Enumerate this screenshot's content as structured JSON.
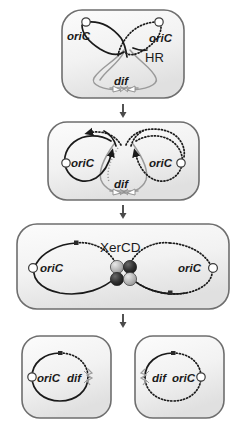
{
  "figure": {
    "width": 246,
    "height": 440,
    "colors": {
      "cell_fill_light": "#fbfbfb",
      "cell_fill_shadow": "#e3e3e3",
      "cell_border": "#6e6e6e",
      "chromosome_dark": "#1a1a1a",
      "chromosome_grey": "#9a9a9a",
      "arrow": "#4a4a4a",
      "background": "#ffffff"
    }
  },
  "panels": [
    {
      "id": "panel-1",
      "name": "dimer-formation",
      "labels": {
        "oric_left": "oriC",
        "oric_right": "oriC",
        "hr": "HR",
        "dif": "dif"
      }
    },
    {
      "id": "panel-2",
      "name": "dimer-segregation",
      "labels": {
        "oric_left": "oriC",
        "oric_right": "oriC",
        "dif": "dif"
      }
    },
    {
      "id": "panel-3",
      "name": "xercd-recombination",
      "labels": {
        "oric_left": "oriC",
        "oric_right": "oriC",
        "xercd": "XerCD"
      },
      "xercd_subunits": [
        {
          "name": "xerC-upper-left",
          "shade": "light"
        },
        {
          "name": "xerD-upper-right",
          "shade": "dark"
        },
        {
          "name": "xerD-lower-left",
          "shade": "dark"
        },
        {
          "name": "xerC-lower-right",
          "shade": "light"
        }
      ]
    },
    {
      "id": "panel-4-left",
      "name": "resolved-monomer-left",
      "labels": {
        "oric": "oriC",
        "dif": "dif"
      }
    },
    {
      "id": "panel-4-right",
      "name": "resolved-monomer-right",
      "labels": {
        "dif": "dif",
        "oric": "oriC"
      }
    }
  ],
  "arrows": [
    {
      "name": "arrow-step-1-to-2"
    },
    {
      "name": "arrow-step-2-to-3"
    },
    {
      "name": "arrow-step-3-to-4"
    }
  ]
}
